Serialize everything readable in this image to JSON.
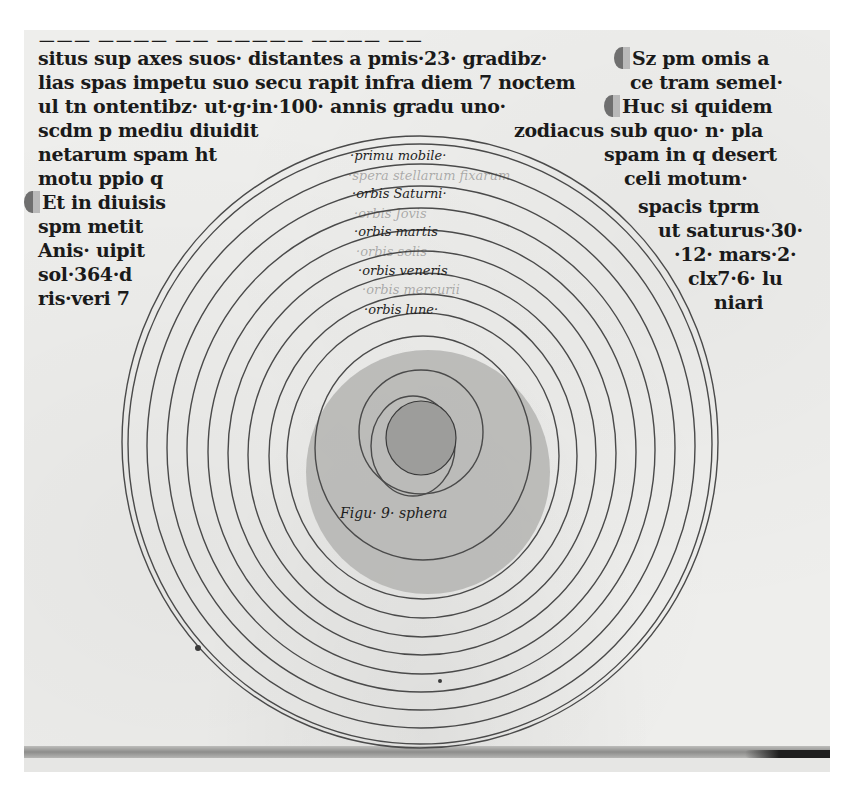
{
  "document": {
    "type": "medieval manuscript page",
    "colors": {
      "parchment": "#eeeeec",
      "ink": "#1a1a1a",
      "ring_line": "#4a4a4a",
      "shaded_disc": "#b4b4b2"
    }
  },
  "left_column": {
    "lines": [
      "situs sup axes suos· distantes a pmis·23· gradibz·",
      "lias spas impetu suo secu rapit infra diem 7 noctem",
      "ul tn ontentibz· ut·g·in·100· annis gradu uno·",
      "scdm p mediu diuidit",
      "netarum spam ht",
      "motu ppio q",
      "Et in diuisis",
      "spm metit",
      "Anis· uipit",
      "sol·364·d",
      "ris·veri 7"
    ]
  },
  "right_column": {
    "lines": [
      "Sz pm omis a",
      "ce tram semel·",
      "Huc si quidem",
      "zodiacus sub quo· n· pla",
      "spam in q desert",
      "celi motum·",
      "spacis tprm",
      "ut saturus·30·",
      "·12· mars·2·",
      "clx7·6· lu",
      "niari"
    ]
  },
  "diagram": {
    "caption": "Figu· 9· sphera",
    "sphere_labels": [
      {
        "text": "·primu mobile·",
        "faded": false
      },
      {
        "text": "·spera stellarum fixarum",
        "faded": true
      },
      {
        "text": "·orbis Saturni·",
        "faded": false
      },
      {
        "text": "·orbis Jovis",
        "faded": true
      },
      {
        "text": "·orbis martis",
        "faded": false
      },
      {
        "text": "·orbis solis",
        "faded": true
      },
      {
        "text": "·orbis veneris",
        "faded": false
      },
      {
        "text": "·orbis mercurii",
        "faded": true
      },
      {
        "text": "·orbis lune·",
        "faded": false
      }
    ],
    "ring_count": 13
  }
}
